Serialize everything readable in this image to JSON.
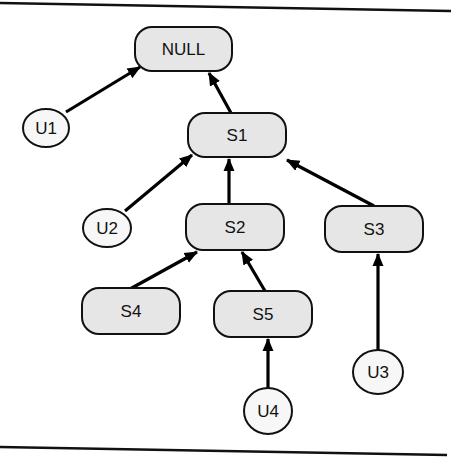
{
  "diagram": {
    "type": "tree",
    "nodes": [
      {
        "id": "NULL",
        "label": "NULL",
        "shape": "rounded-rect",
        "x": 135,
        "y": 27,
        "w": 97,
        "h": 44
      },
      {
        "id": "S1",
        "label": "S1",
        "shape": "rounded-rect",
        "x": 188,
        "y": 113,
        "w": 98,
        "h": 44
      },
      {
        "id": "S2",
        "label": "S2",
        "shape": "rounded-rect",
        "x": 186,
        "y": 204,
        "w": 98,
        "h": 46
      },
      {
        "id": "S3",
        "label": "S3",
        "shape": "rounded-rect",
        "x": 325,
        "y": 206,
        "w": 98,
        "h": 46
      },
      {
        "id": "S4",
        "label": "S4",
        "shape": "rounded-rect",
        "x": 82,
        "y": 288,
        "w": 98,
        "h": 46
      },
      {
        "id": "S5",
        "label": "S5",
        "shape": "rounded-rect",
        "x": 214,
        "y": 291,
        "w": 98,
        "h": 46
      },
      {
        "id": "U1",
        "label": "U1",
        "shape": "circle",
        "cx": 46,
        "cy": 128,
        "rx": 23,
        "ry": 19
      },
      {
        "id": "U2",
        "label": "U2",
        "shape": "circle",
        "cx": 107,
        "cy": 228,
        "rx": 24,
        "ry": 19
      },
      {
        "id": "U3",
        "label": "U3",
        "shape": "circle",
        "cx": 378,
        "cy": 372,
        "rx": 25,
        "ry": 22
      },
      {
        "id": "U4",
        "label": "U4",
        "shape": "circle",
        "cx": 268,
        "cy": 411,
        "rx": 24,
        "ry": 23
      }
    ],
    "edges": [
      {
        "from": "U1",
        "to": "NULL",
        "x1": 66,
        "y1": 112,
        "x2": 140,
        "y2": 67
      },
      {
        "from": "S1",
        "to": "NULL",
        "x1": 231,
        "y1": 113,
        "x2": 209,
        "y2": 73
      },
      {
        "from": "U2",
        "to": "S1",
        "x1": 125,
        "y1": 211,
        "x2": 192,
        "y2": 155
      },
      {
        "from": "S2",
        "to": "S1",
        "x1": 229,
        "y1": 204,
        "x2": 229,
        "y2": 159
      },
      {
        "from": "S3",
        "to": "S1",
        "x1": 374,
        "y1": 206,
        "x2": 287,
        "y2": 160
      },
      {
        "from": "S4",
        "to": "S2",
        "x1": 130,
        "y1": 289,
        "x2": 197,
        "y2": 252
      },
      {
        "from": "S5",
        "to": "S2",
        "x1": 265,
        "y1": 291,
        "x2": 242,
        "y2": 252
      },
      {
        "from": "U3",
        "to": "S3",
        "x1": 378,
        "y1": 350,
        "x2": 378,
        "y2": 254
      },
      {
        "from": "U4",
        "to": "S5",
        "x1": 268,
        "y1": 388,
        "x2": 268,
        "y2": 339
      }
    ],
    "colors": {
      "box_fill": "#e6e6e6",
      "circle_fill": "#f7f7f7",
      "stroke": "#111111"
    }
  }
}
